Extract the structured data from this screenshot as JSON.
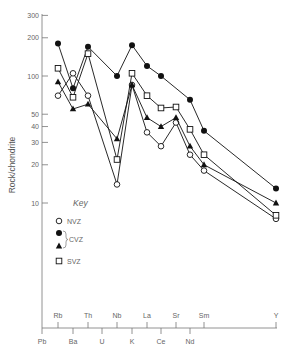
{
  "chart_data": {
    "type": "line",
    "title": "",
    "xlabel": "",
    "ylabel": "Rock/chondrite",
    "yscale": "log",
    "ylim": [
      1,
      300
    ],
    "yticks": [
      10,
      20,
      30,
      40,
      50,
      100,
      200,
      300
    ],
    "grid": false,
    "legend_position": "inside-left",
    "legend_title": "Key",
    "x_upper_labels": [
      "Rb",
      "Th",
      "Nb",
      "La",
      "Sr",
      "Sm",
      "Y"
    ],
    "x_lower_labels": [
      "Pb",
      "Ba",
      "U",
      "K",
      "Ce",
      "Nd"
    ],
    "categories": [
      "Pb",
      "Rb",
      "Ba",
      "Th",
      "U",
      "Nb",
      "K",
      "La",
      "Ce",
      "Sr",
      "Nd",
      "Sm",
      "Y"
    ],
    "series": [
      {
        "name": "NVZ",
        "marker": "open-circle",
        "points": {
          "Rb": 70,
          "Ba": 105,
          "Th": 70,
          "Nb": 14,
          "K": 85,
          "La": 36,
          "Ce": 28,
          "Sr": 43,
          "Nd": 24,
          "Sm": 18,
          "Y": 7.5
        }
      },
      {
        "name": "CVZ (circle)",
        "group": "CVZ",
        "marker": "filled-circle",
        "points": {
          "Rb": 180,
          "Ba": 80,
          "Th": 170,
          "Nb": 100,
          "K": 175,
          "La": 120,
          "Ce": 100,
          "Nd": 65,
          "Sm": 37,
          "Y": 13
        }
      },
      {
        "name": "CVZ (triangle)",
        "group": "CVZ",
        "marker": "filled-triangle",
        "points": {
          "Rb": 90,
          "Ba": 55,
          "Th": 60,
          "Nb": 32,
          "K": 85,
          "La": 47,
          "Ce": 40,
          "Sr": 47,
          "Nd": 28,
          "Sm": 20,
          "Y": 10
        }
      },
      {
        "name": "SVZ",
        "marker": "open-square",
        "points": {
          "Rb": 115,
          "Ba": 68,
          "Th": 150,
          "Nb": 22,
          "K": 105,
          "La": 70,
          "Ce": 56,
          "Sr": 57,
          "Nd": 38,
          "Sm": 24,
          "Y": 8
        }
      }
    ]
  },
  "legend": {
    "title": "Key",
    "items": [
      {
        "marker": "open-circle",
        "label": "NVZ"
      },
      {
        "marker": "filled-circle",
        "label": ""
      },
      {
        "marker": "filled-triangle",
        "label": ""
      },
      {
        "marker": "open-square",
        "label": "SVZ"
      }
    ],
    "cvz_label": "CVZ"
  },
  "y_tick_labels": [
    "300",
    "200",
    "100",
    "50",
    "40",
    "30",
    "20",
    "10"
  ]
}
